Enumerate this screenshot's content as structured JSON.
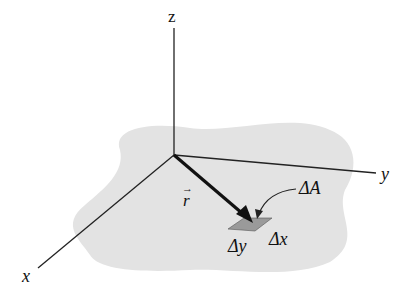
{
  "figure": {
    "colors": {
      "background": "#ffffff",
      "region_fill": "#e3e3e3",
      "axis_stroke": "#222222",
      "vector_stroke": "#111111",
      "patch_fill": "#9a9a9a"
    },
    "axes": {
      "x": {
        "label": "x"
      },
      "y": {
        "label": "y"
      },
      "z": {
        "label": "z"
      }
    },
    "vector": {
      "label": "r",
      "arrow_symbol": "→"
    },
    "area_element": {
      "label": "ΔA",
      "dx_label": "Δx",
      "dy_label": "Δy"
    }
  }
}
